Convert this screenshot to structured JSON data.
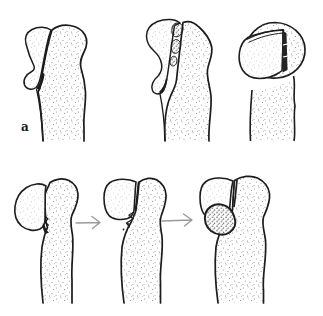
{
  "figure": {
    "label": "a",
    "background_color": "#ffffff",
    "ink_color": "#1c1c1c",
    "stipple_color": "#8b8b8b",
    "arrow_color": "#9a9a9a",
    "arrow_icon": "→",
    "top_row_panels": [
      "long-bone-with-avulsed-flake-fragment-displaced",
      "long-bone-with-debris-in-fracture-gap",
      "bone-head-axial-view-with-shell-fragment"
    ],
    "bottom_row_panels": [
      "bone-with-tilted-marginal-fragment",
      "bone-with-fragment-partially-reduced",
      "bone-with-healed-fragment-and-callus"
    ],
    "arrow_count": 2
  }
}
